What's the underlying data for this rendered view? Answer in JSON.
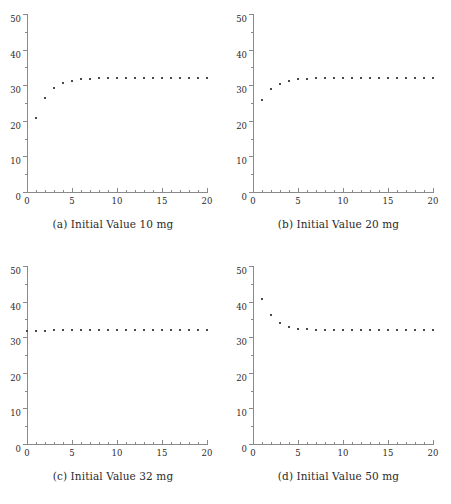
{
  "figure": {
    "panel_captions": [
      "(a) Initial Value 10 mg",
      "(b) Initial Value 20 mg",
      "(c) Initial Value 32 mg",
      "(d) Initial Value 50 mg"
    ]
  },
  "axes": {
    "y_ticks": [
      0,
      10,
      20,
      30,
      40,
      50
    ],
    "y_tick_labels": [
      "0",
      "10",
      "20",
      "30",
      "40",
      "50"
    ],
    "y_minor_ticks": [
      5,
      15,
      25,
      35,
      45
    ],
    "x_ticks": [
      0,
      5,
      10,
      15,
      20
    ],
    "x_tick_labels": [
      "0",
      "5",
      "10",
      "15",
      "20"
    ],
    "x_minor_ticks": [
      1,
      2,
      3,
      4,
      6,
      7,
      8,
      9,
      11,
      12,
      13,
      14,
      16,
      17,
      18,
      19
    ],
    "ylim": [
      0,
      50
    ],
    "xlim": [
      0,
      20
    ],
    "marker_color": "#4a4a4a",
    "axis_color": "#8a8a8a"
  },
  "chart_data": [
    {
      "type": "scatter",
      "title": "(a) Initial Value 10 mg",
      "xlabel": "",
      "ylabel": "",
      "xlim": [
        0,
        20
      ],
      "ylim": [
        0,
        50
      ],
      "grid": false,
      "legend": "none",
      "x": [
        1,
        2,
        3,
        4,
        5,
        6,
        7,
        8,
        9,
        10,
        11,
        12,
        13,
        14,
        15,
        16,
        17,
        18,
        19,
        20
      ],
      "y": [
        21.0,
        26.6,
        29.4,
        30.8,
        31.5,
        31.9,
        32.1,
        32.2,
        32.25,
        32.3,
        32.3,
        32.3,
        32.3,
        32.3,
        32.3,
        32.3,
        32.3,
        32.3,
        32.3,
        32.3
      ]
    },
    {
      "type": "scatter",
      "title": "(b) Initial Value 20 mg",
      "xlabel": "",
      "ylabel": "",
      "xlim": [
        0,
        20
      ],
      "ylim": [
        0,
        50
      ],
      "grid": false,
      "legend": "none",
      "x": [
        1,
        2,
        3,
        4,
        5,
        6,
        7,
        8,
        9,
        10,
        11,
        12,
        13,
        14,
        15,
        16,
        17,
        18,
        19,
        20
      ],
      "y": [
        26.1,
        29.3,
        30.7,
        31.6,
        32.0,
        32.1,
        32.2,
        32.25,
        32.3,
        32.3,
        32.3,
        32.3,
        32.3,
        32.3,
        32.3,
        32.3,
        32.3,
        32.3,
        32.3,
        32.3
      ]
    },
    {
      "type": "scatter",
      "title": "(c) Initial Value 32 mg",
      "xlabel": "",
      "ylabel": "",
      "xlim": [
        0,
        20
      ],
      "ylim": [
        0,
        50
      ],
      "grid": false,
      "legend": "none",
      "x": [
        0,
        1,
        2,
        3,
        4,
        5,
        6,
        7,
        8,
        9,
        10,
        11,
        12,
        13,
        14,
        15,
        16,
        17,
        18,
        19,
        20
      ],
      "y": [
        32.0,
        32.1,
        32.15,
        32.2,
        32.2,
        32.25,
        32.25,
        32.3,
        32.3,
        32.3,
        32.3,
        32.3,
        32.3,
        32.3,
        32.3,
        32.3,
        32.3,
        32.3,
        32.3,
        32.3,
        32.3
      ]
    },
    {
      "type": "scatter",
      "title": "(d) Initial Value 50 mg",
      "xlabel": "",
      "ylabel": "",
      "xlim": [
        0,
        20
      ],
      "ylim": [
        0,
        50
      ],
      "grid": false,
      "legend": "none",
      "x": [
        1,
        2,
        3,
        4,
        5,
        6,
        7,
        8,
        9,
        10,
        11,
        12,
        13,
        14,
        15,
        16,
        17,
        18,
        19,
        20
      ],
      "y": [
        41.0,
        36.6,
        34.2,
        33.2,
        32.7,
        32.5,
        32.4,
        32.35,
        32.3,
        32.3,
        32.3,
        32.3,
        32.3,
        32.3,
        32.3,
        32.3,
        32.3,
        32.3,
        32.3,
        32.3
      ]
    }
  ]
}
